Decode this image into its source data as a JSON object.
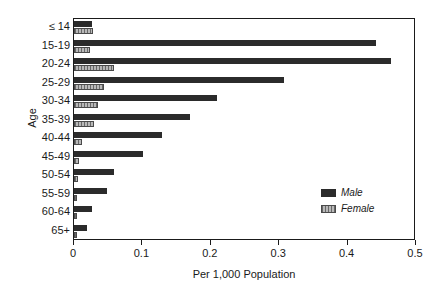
{
  "chart_data": {
    "type": "bar",
    "orientation": "horizontal",
    "title": "",
    "xlabel": "Per 1,000 Population",
    "ylabel": "Age",
    "xlim": [
      0,
      0.5
    ],
    "xticks": [
      "0",
      "0.1",
      "0.2",
      "0.3",
      "0.4",
      "0.5"
    ],
    "xtick_values": [
      0,
      0.1,
      0.2,
      0.3,
      0.4,
      0.5
    ],
    "grid": false,
    "legend_position": "inside-lower-right",
    "categories": [
      "≤ 14",
      "15-19",
      "20-24",
      "25-29",
      "30-34",
      "35-39",
      "40-44",
      "45-49",
      "50-54",
      "55-59",
      "60-64",
      "65+"
    ],
    "series": [
      {
        "name": "Male",
        "color": "#2b2b2b",
        "values": [
          0.027,
          0.441,
          0.463,
          0.307,
          0.209,
          0.17,
          0.129,
          0.101,
          0.058,
          0.048,
          0.026,
          0.019
        ]
      },
      {
        "name": "Female",
        "color": "#b8b8b8",
        "values": [
          0.028,
          0.023,
          0.058,
          0.044,
          0.035,
          0.029,
          0.012,
          0.008,
          0.006,
          0.005,
          0.005,
          0.005
        ]
      }
    ]
  },
  "legend": {
    "items": [
      {
        "label": "Male",
        "swatch": "male-swatch"
      },
      {
        "label": "Female",
        "swatch": "female-swatch"
      }
    ]
  }
}
